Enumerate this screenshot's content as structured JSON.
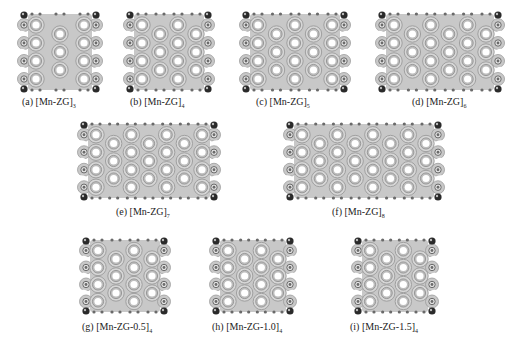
{
  "figure": {
    "colors": {
      "background": "#ffffff",
      "density_fill": "#c8c8c8",
      "density_contour": "#9a9a9a",
      "ring_hole": "#ffffff",
      "edge_atom": "#6a6a6a",
      "edge_atom_dark": "#2a2a2a"
    },
    "panels": [
      {
        "id": "a",
        "label": "(a) [Mn-ZG]",
        "subscript": "3",
        "cols": 3,
        "rows": 4,
        "x": 14,
        "y": 8,
        "w": 92,
        "h": 88
      },
      {
        "id": "b",
        "label": "(b) [Mn-ZG]",
        "subscript": "4",
        "cols": 4,
        "rows": 4,
        "x": 120,
        "y": 8,
        "w": 98,
        "h": 88
      },
      {
        "id": "c",
        "label": "(c) [Mn-ZG]",
        "subscript": "5",
        "cols": 5,
        "rows": 4,
        "x": 236,
        "y": 8,
        "w": 118,
        "h": 88
      },
      {
        "id": "d",
        "label": "(d) [Mn-ZG]",
        "subscript": "6",
        "cols": 6,
        "rows": 4,
        "x": 372,
        "y": 8,
        "w": 136,
        "h": 88
      },
      {
        "id": "e",
        "label": "(e) [Mn-ZG]",
        "subscript": "7",
        "cols": 7,
        "rows": 4,
        "x": 74,
        "y": 118,
        "w": 150,
        "h": 86
      },
      {
        "id": "f",
        "label": "(f) [Mn-ZG]",
        "subscript": "8",
        "cols": 8,
        "rows": 4,
        "x": 280,
        "y": 118,
        "w": 168,
        "h": 86
      },
      {
        "id": "g",
        "label": "(g) [Mn-ZG-0.5]",
        "subscript": "4",
        "cols": 4,
        "rows": 4,
        "x": 76,
        "y": 234,
        "w": 98,
        "h": 84
      },
      {
        "id": "h",
        "label": "(h) [Mn-ZG-1.0]",
        "subscript": "4",
        "cols": 4,
        "rows": 4,
        "x": 206,
        "y": 234,
        "w": 94,
        "h": 84
      },
      {
        "id": "i",
        "label": "(i) [Mn-ZG-1.5]",
        "subscript": "4",
        "cols": 4,
        "rows": 4,
        "x": 348,
        "y": 234,
        "w": 94,
        "h": 84
      }
    ],
    "captions": [
      {
        "text": "(a) [Mn-ZG]",
        "sub": "3",
        "x": 22,
        "y": 96
      },
      {
        "text": "(b) [Mn-ZG]",
        "sub": "4",
        "x": 130,
        "y": 96
      },
      {
        "text": "(c) [Mn-ZG]",
        "sub": "5",
        "x": 256,
        "y": 96
      },
      {
        "text": "(d) [Mn-ZG]",
        "sub": "6",
        "x": 412,
        "y": 96
      },
      {
        "text": "(e) [Mn-ZG]",
        "sub": "7",
        "x": 116,
        "y": 206
      },
      {
        "text": "(f) [Mn-ZG]",
        "sub": "8",
        "x": 332,
        "y": 206
      },
      {
        "text": "(g) [Mn-ZG-0.5]",
        "sub": "4",
        "x": 82,
        "y": 321
      },
      {
        "text": "(h) [Mn-ZG-1.0]",
        "sub": "4",
        "x": 212,
        "y": 321
      },
      {
        "text": "(i) [Mn-ZG-1.5]",
        "sub": "4",
        "x": 350,
        "y": 321
      }
    ]
  }
}
